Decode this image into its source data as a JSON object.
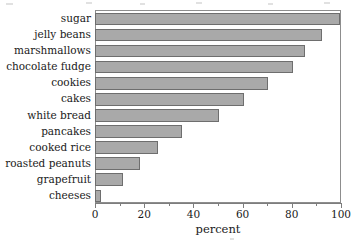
{
  "chart_data": {
    "type": "bar",
    "orientation": "horizontal",
    "title": "",
    "xlabel": "percent",
    "ylabel": "",
    "xlim": [
      0,
      100
    ],
    "xticks": [
      0,
      20,
      40,
      60,
      80,
      100
    ],
    "xtick_labels": [
      "0",
      "20",
      "40",
      "60",
      "80",
      "100"
    ],
    "minor_xticks": [
      10,
      30,
      50,
      70,
      90
    ],
    "grid": false,
    "legend": null,
    "bar_color": "#a9a9a9",
    "bar_edge_color": "#6e6e6e",
    "categories": [
      "sugar",
      "jelly beans",
      "marshmallows",
      "chocolate fudge",
      "cookies",
      "cakes",
      "white bread",
      "pancakes",
      "cooked rice",
      "roasted peanuts",
      "grapefruit",
      "cheeses"
    ],
    "values": [
      99,
      92,
      85,
      80,
      70,
      60,
      50,
      35,
      25,
      18,
      11,
      2
    ]
  }
}
